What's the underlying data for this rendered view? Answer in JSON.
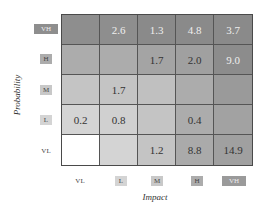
{
  "chart_data": {
    "type": "heatmap",
    "title": "",
    "xlabel": "Impact",
    "ylabel": "Probability",
    "x_categories": [
      "VL",
      "L",
      "M",
      "H",
      "VH"
    ],
    "y_categories_top_to_bottom": [
      "VH",
      "H",
      "M",
      "L",
      "VL"
    ],
    "grid": true,
    "legend": "none",
    "values": [
      {
        "probability": "VH",
        "cells": [
          null,
          2.6,
          1.3,
          4.8,
          3.7
        ]
      },
      {
        "probability": "H",
        "cells": [
          null,
          null,
          1.7,
          2.0,
          9.0
        ]
      },
      {
        "probability": "M",
        "cells": [
          null,
          1.7,
          null,
          null,
          null
        ]
      },
      {
        "probability": "L",
        "cells": [
          0.2,
          0.8,
          null,
          0.4,
          null
        ]
      },
      {
        "probability": "VL",
        "cells": [
          null,
          null,
          1.2,
          8.8,
          14.9
        ]
      }
    ],
    "cell_colors": [
      [
        "#8e8e8e",
        "#8e8e8e",
        "#8a8a8a",
        "#8a8a8a",
        "#8a8a8a"
      ],
      [
        "#acacac",
        "#acacac",
        "#a4a4a4",
        "#a0a0a0",
        "#8c8c8c"
      ],
      [
        "#c4c4c4",
        "#c4c4c4",
        "#c0c0c0",
        "#acacac",
        "#9a9a9a"
      ],
      [
        "#d4d4d4",
        "#d0d0d0",
        "#c4c4c4",
        "#acacac",
        "#a2a2a2"
      ],
      [
        "#ffffff",
        "#d4d4d4",
        "#c4c4c4",
        "#aaaaaa",
        "#a0a0a0"
      ]
    ],
    "text_colors": [
      [
        "#eeeeee",
        "#eeeeee",
        "#eeeeee",
        "#eeeeee",
        "#eeeeee"
      ],
      [
        "#333333",
        "#333333",
        "#333333",
        "#333333",
        "#eeeeee"
      ],
      [
        "#333333",
        "#333333",
        "#333333",
        "#333333",
        "#333333"
      ],
      [
        "#333333",
        "#333333",
        "#333333",
        "#333333",
        "#333333"
      ],
      [
        "#333333",
        "#333333",
        "#333333",
        "#333333",
        "#333333"
      ]
    ],
    "y_label_boxes": {
      "VH": "#8e8e8e",
      "H": "#acacac",
      "M": "#c8c8c8",
      "L": "#d4d4d4",
      "VL": null
    },
    "x_label_boxes": {
      "VL": null,
      "L": "#d4d4d4",
      "M": "#c8c8c8",
      "H": "#acacac",
      "VH": "#9a9a9a"
    }
  },
  "display": {
    "rows": [
      [
        "",
        "2.6",
        "1.3",
        "4.8",
        "3.7"
      ],
      [
        "",
        "",
        "1.7",
        "2.0",
        "9.0"
      ],
      [
        "",
        "1.7",
        "",
        "",
        ""
      ],
      [
        "0.2",
        "0.8",
        "",
        "0.4",
        ""
      ],
      [
        "",
        "",
        "1.2",
        "8.8",
        "14.9"
      ]
    ],
    "y_labels": [
      "VH",
      "H",
      "M",
      "L",
      "VL"
    ],
    "x_labels": [
      "VL",
      "L",
      "M",
      "H",
      "VH"
    ],
    "x_title": "Impact",
    "y_title": "Probability"
  }
}
